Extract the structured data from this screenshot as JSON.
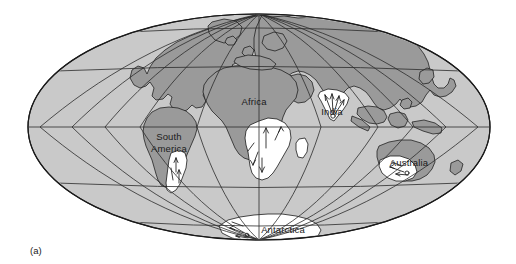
{
  "figure": {
    "caption": "(a)",
    "type": "world-map-projection",
    "projection": "mollweide-oval"
  },
  "colors": {
    "ocean": "#c9c9c9",
    "land": "#9a9a9a",
    "glaciation": "#ffffff",
    "outline": "#1a1a1a",
    "graticule": "#2b2b2b",
    "background": "#ffffff",
    "label_text": "#1a1a1a"
  },
  "map": {
    "ellipse": {
      "center_x": 259,
      "center_y": 127,
      "radius_x": 231,
      "radius_y": 113
    },
    "graticule": {
      "parallels_deg": [
        -60,
        -30,
        0,
        30,
        60
      ],
      "meridians_deg": [
        -150,
        -120,
        -90,
        -60,
        -30,
        0,
        30,
        60,
        90,
        120,
        150
      ],
      "grid_visible": true
    },
    "labels": [
      {
        "name": "africa",
        "text": "Africa",
        "x": 254,
        "y": 102,
        "lines": [
          "Africa"
        ]
      },
      {
        "name": "south-america",
        "text": "South America",
        "x": 169,
        "y": 143,
        "lines": [
          "South",
          "America"
        ]
      },
      {
        "name": "india",
        "text": "India",
        "x": 332,
        "y": 112,
        "lines": [
          "India"
        ]
      },
      {
        "name": "australia",
        "text": "Australia",
        "x": 409,
        "y": 163,
        "lines": [
          "Australia"
        ]
      },
      {
        "name": "antarctica",
        "text": "Antarctica",
        "x": 283,
        "y": 230,
        "lines": [
          "Antarctica"
        ]
      }
    ]
  }
}
